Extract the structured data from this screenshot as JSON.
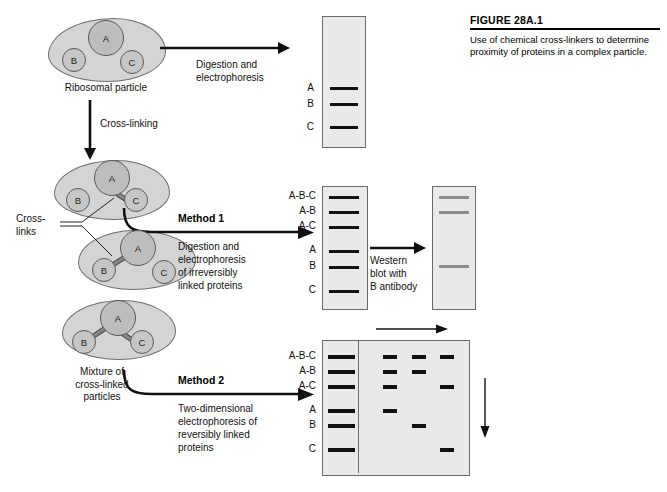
{
  "figure": {
    "title": "FIGURE 28A.1",
    "caption": "Use of chemical cross-linkers to determine proximity of proteins in a complex particle."
  },
  "particles": {
    "native": {
      "label": "Ribosomal particle",
      "proteins": [
        "A",
        "B",
        "C"
      ]
    },
    "crosslinked_label": "Cross-\nlinks",
    "crosslinks_line1": "Cross-",
    "crosslinks_line2": "links",
    "mixture_label_line1": "Mixture of",
    "mixture_label_line2": "cross-linked",
    "mixture_label_line3": "particles",
    "variants": [
      {
        "name": "A-C particle",
        "proteins": [
          "A",
          "B",
          "C"
        ],
        "links": [
          "A-C"
        ]
      },
      {
        "name": "A-B particle",
        "proteins": [
          "A",
          "B",
          "C"
        ],
        "links": [
          "A-B"
        ]
      },
      {
        "name": "A-B and A-C particle",
        "proteins": [
          "A",
          "B",
          "C"
        ],
        "links": [
          "A-B",
          "A-C"
        ]
      }
    ]
  },
  "steps": {
    "digestion": {
      "line1": "Digestion and",
      "line2": "electrophoresis"
    },
    "crosslinking": {
      "label": "Cross-linking"
    },
    "method1": {
      "heading": "Method 1",
      "line1": "Digestion and",
      "line2": "electrophoresis",
      "line3": "of irreversibly",
      "line4": "linked proteins"
    },
    "method2": {
      "heading": "Method 2",
      "line1": "Two-dimensional",
      "line2": "electrophoresis of",
      "line3": "reversibly linked",
      "line4": "proteins"
    },
    "western": {
      "line1": "Western",
      "line2": "blot with",
      "line3": "B antibody"
    }
  },
  "gels": {
    "native_gel": {
      "name": "native-protein-gel",
      "labels": [
        "A",
        "B",
        "C"
      ],
      "band_rows": [
        1,
        2,
        3
      ]
    },
    "method1_gel": {
      "name": "method1-gel",
      "labels": [
        "A-B-C",
        "A-B",
        "A-C",
        "A",
        "B",
        "C"
      ],
      "band_rows": [
        1,
        2,
        3,
        4,
        5,
        6
      ]
    },
    "western_gel": {
      "name": "western-blot-gel",
      "band_rows": [
        1,
        2,
        5
      ],
      "band_color": "#8d8d8d"
    },
    "twod_gel": {
      "name": "two-dimensional-gel",
      "labels": [
        "A-B-C",
        "A-B",
        "A-C",
        "A",
        "B",
        "C"
      ],
      "first_dimension_rows": [
        1,
        2,
        3,
        4,
        5,
        6
      ],
      "second_dimension_spots": [
        {
          "row": "A-B-C",
          "columns": [
            1,
            2,
            3
          ]
        },
        {
          "row": "A-B",
          "columns": [
            1,
            2
          ]
        },
        {
          "row": "A-C",
          "columns": [
            1,
            3
          ]
        },
        {
          "row": "A",
          "columns": [
            1
          ]
        },
        {
          "row": "B",
          "columns": [
            2
          ]
        },
        {
          "row": "C",
          "columns": [
            3
          ]
        }
      ],
      "axis_arrows": {
        "horizontal": "second-dimension-direction",
        "vertical": "first-dimension-direction"
      }
    }
  },
  "colors": {
    "gel_background": "#e9e9e9",
    "gel_border": "#6b6b6b",
    "band": "#111111",
    "western_band": "#8d8d8d",
    "blob_fill": "#d4d4d4",
    "protein_fill": "#c6c6c6"
  }
}
